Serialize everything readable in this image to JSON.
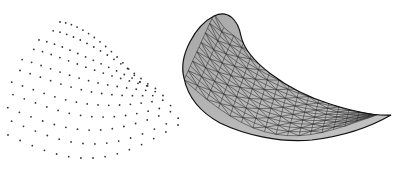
{
  "figure": {
    "background": "#ffffff",
    "colors": {
      "points": "#333333",
      "surface_fill": "#a8a8a8",
      "surface_fill_light": "#c4c4c4",
      "mesh_lines": "#2a2a2a",
      "outline": "#111111"
    }
  },
  "point_cloud": {
    "bounds": {
      "x": [
        5,
        178
      ],
      "y": [
        18,
        167
      ]
    },
    "outline_hint": "dome-shaped cloud, apex near (110,20), base from (5,130) to (178,150)",
    "rows": 11,
    "cols": 15
  },
  "surface": {
    "bounds": {
      "x": [
        181,
        391
      ],
      "y": [
        13,
        141
      ]
    },
    "outer_path": "M184,78 C178,55 196,25 214,16 C228,9 238,20 241,36 C246,60 285,90 330,104 C355,112 378,116 391,115 C372,126 345,136 312,140 C280,143 245,135 220,123 C200,112 188,98 184,78 Z",
    "grid_u": 14,
    "grid_v": 18
  }
}
